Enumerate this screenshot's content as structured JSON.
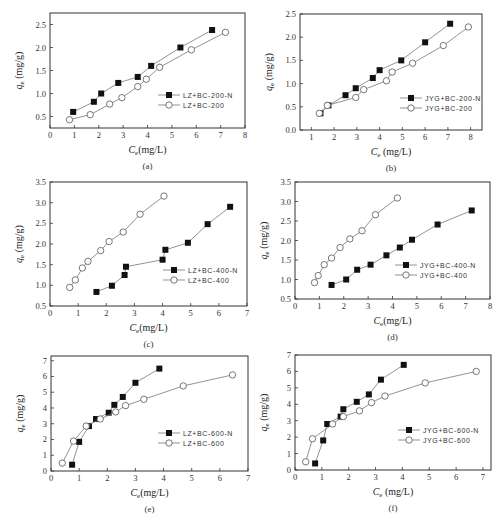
{
  "chart_data": [
    {
      "panel": "a",
      "type": "line",
      "caption": "(a)",
      "xlabel": "Ce(mg/L)",
      "ylabel": "qe (mg/g)",
      "xlim": [
        0,
        8
      ],
      "ylim": [
        0.25,
        2.75
      ],
      "xticks": [
        0,
        1,
        2,
        3,
        4,
        5,
        6,
        7,
        8
      ],
      "yticks": [
        0.5,
        1.0,
        1.5,
        2.0,
        2.5
      ],
      "box": [
        50,
        13,
        245,
        128
      ],
      "legend": {
        "x": 158,
        "y": 95
      },
      "series": [
        {
          "name": "LZ+BC-200-N",
          "marker": "filled-square",
          "x": [
            0.95,
            1.8,
            2.1,
            2.8,
            3.6,
            4.15,
            5.35,
            6.65
          ],
          "y": [
            0.6,
            0.82,
            1.0,
            1.23,
            1.36,
            1.6,
            2.0,
            2.38
          ]
        },
        {
          "name": "LZ+BC-200",
          "marker": "open-circle",
          "x": [
            0.8,
            1.65,
            2.45,
            2.95,
            3.6,
            3.95,
            4.5,
            5.8,
            7.2
          ],
          "y": [
            0.43,
            0.54,
            0.77,
            0.91,
            1.15,
            1.31,
            1.57,
            1.95,
            2.33
          ]
        }
      ]
    },
    {
      "panel": "b",
      "type": "line",
      "caption": "(b)",
      "xlabel": "Ce (mg/L)",
      "ylabel": "qe (mg/g)",
      "xlim": [
        0.5,
        8.5
      ],
      "ylim": [
        0,
        2.5
      ],
      "xticks": [
        1,
        2,
        3,
        4,
        5,
        6,
        7,
        8
      ],
      "yticks": [
        0.0,
        0.5,
        1.0,
        1.5,
        2.0,
        2.5
      ],
      "box": [
        300,
        14,
        482,
        130
      ],
      "legend": {
        "x": 400,
        "y": 98
      },
      "series": [
        {
          "name": "JYG+BC-200-N",
          "marker": "filled-square",
          "x": [
            1.4,
            1.75,
            2.5,
            2.95,
            3.7,
            4.0,
            4.95,
            6.0,
            7.1
          ],
          "y": [
            0.36,
            0.53,
            0.75,
            0.9,
            1.12,
            1.29,
            1.5,
            1.89,
            2.29
          ]
        },
        {
          "name": "JYG+BC-200",
          "marker": "open-circle",
          "x": [
            1.35,
            1.7,
            2.95,
            3.3,
            4.3,
            4.55,
            5.45,
            6.8,
            7.9
          ],
          "y": [
            0.36,
            0.53,
            0.7,
            0.87,
            1.06,
            1.25,
            1.44,
            1.82,
            2.22
          ]
        }
      ]
    },
    {
      "panel": "c",
      "type": "line",
      "caption": "(c)",
      "xlabel": "Ce(mg/L)",
      "ylabel": "qe (mg/g)",
      "xlim": [
        0,
        7
      ],
      "ylim": [
        0.5,
        3.5
      ],
      "xticks": [
        0,
        1,
        2,
        3,
        4,
        5,
        6,
        7
      ],
      "yticks": [
        0.5,
        1.0,
        1.5,
        2.0,
        2.5,
        3.0,
        3.5
      ],
      "box": [
        50,
        182,
        247,
        306
      ],
      "legend": {
        "x": 163,
        "y": 270
      },
      "series": [
        {
          "name": "LZ+BC-400-N",
          "marker": "filled-square",
          "x": [
            1.65,
            2.2,
            2.65,
            2.7,
            4.0,
            4.1,
            4.9,
            5.6,
            6.4
          ],
          "y": [
            0.84,
            0.99,
            1.25,
            1.45,
            1.62,
            1.86,
            2.03,
            2.48,
            2.9
          ]
        },
        {
          "name": "LZ+BC-400",
          "marker": "open-circle",
          "x": [
            0.7,
            0.9,
            1.15,
            1.35,
            1.8,
            2.1,
            2.6,
            3.2,
            4.05
          ],
          "y": [
            0.95,
            1.13,
            1.42,
            1.58,
            1.84,
            2.06,
            2.29,
            2.72,
            3.16
          ]
        }
      ]
    },
    {
      "panel": "d",
      "type": "line",
      "caption": "(d)",
      "xlabel": "Ce(mg/L)",
      "ylabel": "qe (mg/g)",
      "xlim": [
        0,
        8
      ],
      "ylim": [
        0.5,
        3.5
      ],
      "xticks": [
        0,
        1,
        2,
        3,
        4,
        5,
        6,
        7,
        8
      ],
      "yticks": [
        0.5,
        1.0,
        1.5,
        2.0,
        2.5,
        3.0,
        3.5
      ],
      "box": [
        295,
        182,
        490,
        299
      ],
      "legend": {
        "x": 395,
        "y": 265
      },
      "series": [
        {
          "name": "JYG+BC-400-N",
          "marker": "filled-square",
          "x": [
            1.5,
            2.1,
            2.55,
            3.1,
            3.75,
            4.3,
            4.8,
            5.85,
            7.25
          ],
          "y": [
            0.86,
            1.0,
            1.25,
            1.38,
            1.62,
            1.82,
            2.02,
            2.41,
            2.77
          ]
        },
        {
          "name": "JYG+BC-400",
          "marker": "open-circle",
          "x": [
            0.8,
            0.95,
            1.2,
            1.5,
            1.85,
            2.25,
            2.75,
            3.3,
            4.2
          ],
          "y": [
            0.92,
            1.1,
            1.38,
            1.55,
            1.82,
            2.04,
            2.25,
            2.66,
            3.09
          ]
        }
      ]
    },
    {
      "panel": "e",
      "type": "line",
      "caption": "(e)",
      "xlabel": "Ce(mg/L)",
      "ylabel": "qe (mg/g)",
      "xlim": [
        0,
        7
      ],
      "ylim": [
        0,
        7.3
      ],
      "xticks": [
        0,
        1,
        2,
        3,
        4,
        5,
        6,
        7
      ],
      "yticks": [
        0,
        1,
        2,
        3,
        4,
        5,
        6,
        7
      ],
      "box": [
        51,
        356,
        248,
        471
      ],
      "legend": {
        "x": 158,
        "y": 433
      },
      "series": [
        {
          "name": "LZ+BC-600-N",
          "marker": "filled-square",
          "x": [
            0.75,
            1.0,
            1.35,
            1.6,
            2.05,
            2.25,
            2.55,
            3.0,
            3.85
          ],
          "y": [
            0.4,
            1.85,
            2.85,
            3.3,
            3.7,
            4.2,
            4.7,
            5.6,
            6.5
          ]
        },
        {
          "name": "LZ+BC-600",
          "marker": "open-circle",
          "x": [
            0.4,
            0.8,
            1.25,
            1.75,
            2.3,
            2.65,
            3.3,
            4.7,
            6.45
          ],
          "y": [
            0.5,
            1.9,
            2.85,
            3.3,
            3.75,
            4.15,
            4.55,
            5.4,
            6.1
          ]
        }
      ]
    },
    {
      "panel": "f",
      "type": "line",
      "caption": "(f)",
      "xlabel": "Ce (mg/L)",
      "ylabel": "qe (mg/g)",
      "xlim": [
        0,
        7.3
      ],
      "ylim": [
        0,
        7
      ],
      "xticks": [
        0,
        1,
        2,
        3,
        4,
        5,
        6,
        7
      ],
      "yticks": [
        0,
        1,
        2,
        3,
        4,
        5,
        6,
        7
      ],
      "box": [
        295,
        355,
        491,
        470
      ],
      "legend": {
        "x": 398,
        "y": 430
      },
      "series": [
        {
          "name": "JYG+BC-600-N",
          "marker": "filled-square",
          "x": [
            0.75,
            1.05,
            1.2,
            1.7,
            1.8,
            2.3,
            2.75,
            3.2,
            4.05
          ],
          "y": [
            0.4,
            1.8,
            2.8,
            3.25,
            3.7,
            4.15,
            4.6,
            5.5,
            6.4
          ]
        },
        {
          "name": "JYG+BC-600",
          "marker": "open-circle",
          "x": [
            0.4,
            0.65,
            1.4,
            1.8,
            2.4,
            2.85,
            3.35,
            4.85,
            6.75
          ],
          "y": [
            0.5,
            1.9,
            2.8,
            3.25,
            3.6,
            4.1,
            4.5,
            5.3,
            6.0
          ]
        }
      ]
    }
  ]
}
